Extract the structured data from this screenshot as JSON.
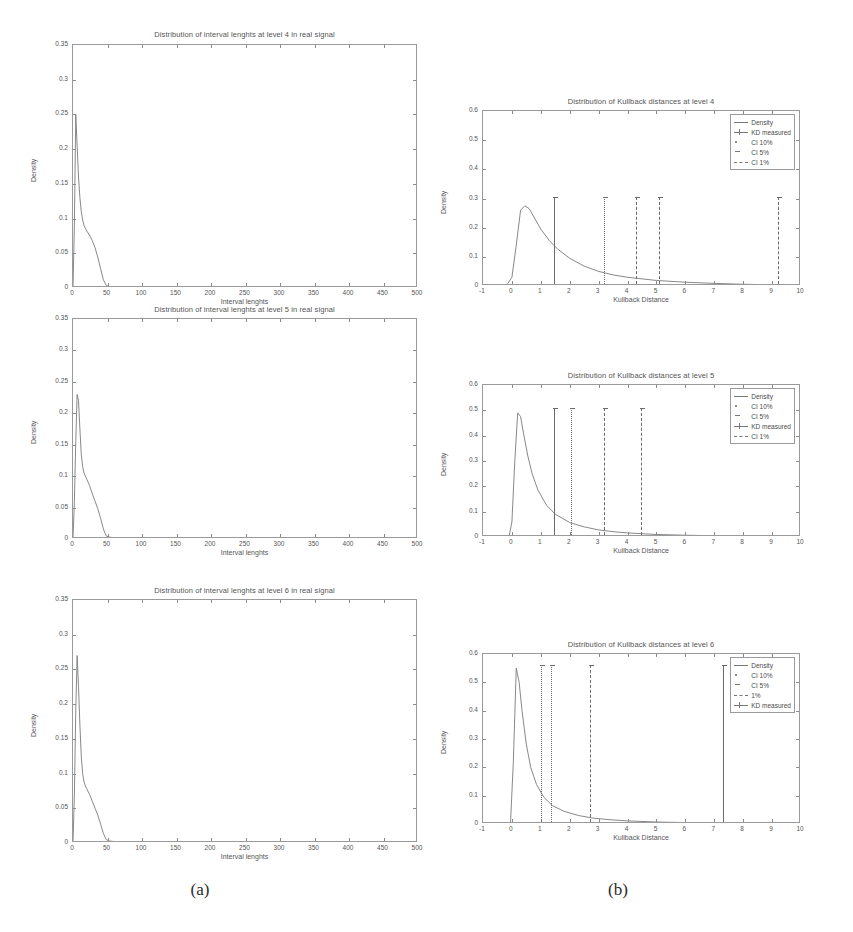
{
  "figure": {
    "captions": [
      {
        "label": "(a)",
        "x": 200,
        "y": 880
      },
      {
        "label": "(b)",
        "x": 618,
        "y": 880
      }
    ]
  },
  "chart_data": [
    {
      "id": "interval-level-4",
      "type": "line",
      "title": "Distribution of interval lenghts at level 4  in real signal",
      "xlabel": "Interval lenghts",
      "ylabel": "Density",
      "xlim": [
        0,
        500
      ],
      "ylim": [
        0,
        0.35
      ],
      "xticks": [
        0,
        50,
        100,
        150,
        200,
        250,
        300,
        350,
        400,
        450,
        500
      ],
      "yticks": [
        0,
        0.05,
        0.1,
        0.15,
        0.2,
        0.25,
        0.3,
        0.35
      ],
      "ytick_labels": [
        "0",
        "0.05",
        "0.1",
        "0.15",
        "0.2",
        "0.25",
        "0.3",
        "0.35"
      ],
      "grid": false,
      "series": [
        {
          "name": "Density",
          "x": [
            0,
            2,
            4,
            6,
            8,
            10,
            12,
            14,
            16,
            18,
            20,
            24,
            28,
            32,
            36,
            40,
            44,
            48,
            52,
            60,
            70,
            80,
            100,
            150,
            200,
            250,
            300,
            350,
            400,
            450,
            500
          ],
          "y": [
            0.0,
            0.09,
            0.25,
            0.205,
            0.16,
            0.13,
            0.11,
            0.098,
            0.09,
            0.086,
            0.082,
            0.076,
            0.068,
            0.058,
            0.044,
            0.028,
            0.012,
            0.004,
            0.002,
            0.0015,
            0.001,
            0.001,
            0.0008,
            0.0006,
            0.0005,
            0.0004,
            0.0003,
            0.0002,
            0.0002,
            0.0001,
            0.0001
          ]
        }
      ]
    },
    {
      "id": "kullback-level-4",
      "type": "line",
      "title": "Distribution of Kullback distances at level 4",
      "xlabel": "Kullback Distance",
      "ylabel": "Density",
      "xlim": [
        -1,
        10
      ],
      "ylim": [
        0,
        0.6
      ],
      "xticks": [
        -1,
        0,
        1,
        2,
        3,
        4,
        5,
        6,
        7,
        8,
        9,
        10
      ],
      "yticks": [
        0,
        0.1,
        0.2,
        0.3,
        0.4,
        0.5,
        0.6
      ],
      "ytick_labels": [
        "0",
        "0.1",
        "0.2",
        "0.3",
        "0.4",
        "0.5",
        "0.6"
      ],
      "grid": false,
      "series": [
        {
          "name": "Density",
          "x": [
            -1,
            -0.2,
            0.0,
            0.15,
            0.3,
            0.45,
            0.6,
            0.8,
            1.0,
            1.3,
            1.6,
            2.0,
            2.5,
            3.0,
            3.5,
            4.0,
            5.0,
            6.0,
            7.0,
            8.0,
            9.0,
            10.0
          ],
          "y": [
            0.0,
            0.0,
            0.03,
            0.14,
            0.26,
            0.275,
            0.265,
            0.23,
            0.195,
            0.155,
            0.125,
            0.095,
            0.068,
            0.05,
            0.038,
            0.03,
            0.019,
            0.013,
            0.009,
            0.006,
            0.004,
            0.003
          ]
        }
      ],
      "markers": [
        {
          "name": "KD measured",
          "x": 1.45,
          "height": 0.3,
          "style": "solid"
        },
        {
          "name": "CI 10%",
          "x": 3.2,
          "height": 0.3,
          "style": "dotted"
        },
        {
          "name": "CI 5%",
          "x": 4.3,
          "height": 0.3,
          "style": "dashed"
        },
        {
          "name": "CI 1%",
          "x": 5.1,
          "height": 0.3,
          "style": "dashed"
        },
        {
          "name": "CI 1%",
          "x": 9.2,
          "height": 0.3,
          "style": "dashed"
        }
      ],
      "legend": {
        "position": "top-right",
        "entries": [
          {
            "label": "Density",
            "symbol": "solid"
          },
          {
            "label": "KD measured",
            "symbol": "cross"
          },
          {
            "label": "CI 10%",
            "symbol": "dot"
          },
          {
            "label": "CI 5%",
            "symbol": "dot2"
          },
          {
            "label": "CI 1%",
            "symbol": "dashdot"
          }
        ]
      }
    },
    {
      "id": "interval-level-5",
      "type": "line",
      "title": "Distribution of interval lenghts at level 5  in real signal",
      "xlabel": "Interval lenghts",
      "ylabel": "Density",
      "xlim": [
        0,
        500
      ],
      "ylim": [
        0,
        0.35
      ],
      "xticks": [
        0,
        50,
        100,
        150,
        200,
        250,
        300,
        350,
        400,
        450,
        500
      ],
      "yticks": [
        0,
        0.05,
        0.1,
        0.15,
        0.2,
        0.25,
        0.3,
        0.35
      ],
      "ytick_labels": [
        "0",
        "0.05",
        "0.1",
        "0.15",
        "0.2",
        "0.25",
        "0.3",
        "0.35"
      ],
      "grid": false,
      "series": [
        {
          "name": "Density",
          "x": [
            0,
            2,
            4,
            6,
            8,
            10,
            12,
            14,
            16,
            18,
            20,
            24,
            28,
            32,
            36,
            40,
            44,
            48,
            52,
            60,
            70,
            80,
            100,
            150,
            200,
            250,
            300,
            350,
            400,
            450,
            500
          ],
          "y": [
            0.0,
            0.06,
            0.155,
            0.23,
            0.22,
            0.175,
            0.135,
            0.115,
            0.105,
            0.1,
            0.095,
            0.085,
            0.072,
            0.06,
            0.048,
            0.033,
            0.016,
            0.005,
            0.003,
            0.002,
            0.0015,
            0.0012,
            0.001,
            0.0008,
            0.0006,
            0.0005,
            0.0004,
            0.0003,
            0.0002,
            0.0002,
            0.0001
          ]
        }
      ]
    },
    {
      "id": "kullback-level-5",
      "type": "line",
      "title": "Distribution of Kullback distances at level 5",
      "xlabel": "Kullback Distance",
      "ylabel": "Density",
      "xlim": [
        -1,
        10
      ],
      "ylim": [
        0,
        0.6
      ],
      "xticks": [
        -1,
        0,
        1,
        2,
        3,
        4,
        5,
        6,
        7,
        8,
        9,
        10
      ],
      "yticks": [
        0,
        0.1,
        0.2,
        0.3,
        0.4,
        0.5,
        0.6
      ],
      "ytick_labels": [
        "0",
        "0.1",
        "0.2",
        "0.3",
        "0.4",
        "0.5",
        "0.6"
      ],
      "grid": false,
      "series": [
        {
          "name": "Density",
          "x": [
            -1,
            -0.1,
            0.0,
            0.1,
            0.2,
            0.3,
            0.4,
            0.55,
            0.7,
            0.9,
            1.2,
            1.5,
            2.0,
            2.5,
            3.0,
            3.5,
            4.0,
            5.0,
            6.0,
            7.0,
            8.0,
            9.0,
            10.0
          ],
          "y": [
            0.0,
            0.0,
            0.06,
            0.3,
            0.49,
            0.475,
            0.41,
            0.32,
            0.25,
            0.185,
            0.125,
            0.09,
            0.057,
            0.04,
            0.028,
            0.021,
            0.016,
            0.01,
            0.007,
            0.005,
            0.004,
            0.003,
            0.002
          ]
        }
      ],
      "markers": [
        {
          "name": "KD measured",
          "x": 1.45,
          "height": 0.5,
          "style": "solid"
        },
        {
          "name": "CI 10%",
          "x": 2.05,
          "height": 0.5,
          "style": "dotted"
        },
        {
          "name": "CI 5%",
          "x": 3.2,
          "height": 0.5,
          "style": "dashed"
        },
        {
          "name": "CI 1%",
          "x": 4.45,
          "height": 0.5,
          "style": "dashed"
        }
      ],
      "legend": {
        "position": "top-right",
        "entries": [
          {
            "label": "Density",
            "symbol": "solid"
          },
          {
            "label": "CI 10%",
            "symbol": "dot"
          },
          {
            "label": "CI 5%",
            "symbol": "dot2"
          },
          {
            "label": "KD measured",
            "symbol": "cross"
          },
          {
            "label": "CI 1%",
            "symbol": "dashdot"
          }
        ]
      }
    },
    {
      "id": "interval-level-6",
      "type": "line",
      "title": "Distribution of interval lenghts at level 6  in real signal",
      "xlabel": "Interval lenghts",
      "ylabel": "Density",
      "xlim": [
        0,
        500
      ],
      "ylim": [
        0,
        0.35
      ],
      "xticks": [
        0,
        50,
        100,
        150,
        200,
        250,
        300,
        350,
        400,
        450,
        500
      ],
      "yticks": [
        0,
        0.05,
        0.1,
        0.15,
        0.2,
        0.25,
        0.3,
        0.35
      ],
      "ytick_labels": [
        "0",
        "0.05",
        "0.1",
        "0.15",
        "0.2",
        "0.25",
        "0.3",
        "0.35"
      ],
      "grid": false,
      "series": [
        {
          "name": "Density",
          "x": [
            0,
            2,
            4,
            6,
            8,
            10,
            12,
            14,
            16,
            18,
            20,
            24,
            28,
            32,
            36,
            40,
            44,
            48,
            52,
            60,
            70,
            80,
            100,
            150,
            200,
            250,
            300,
            350,
            400,
            450,
            500
          ],
          "y": [
            0.0,
            0.07,
            0.19,
            0.27,
            0.225,
            0.17,
            0.125,
            0.1,
            0.088,
            0.082,
            0.078,
            0.07,
            0.06,
            0.05,
            0.04,
            0.027,
            0.014,
            0.005,
            0.003,
            0.002,
            0.0015,
            0.0012,
            0.001,
            0.0008,
            0.0006,
            0.0005,
            0.0004,
            0.0003,
            0.0002,
            0.0002,
            0.0001
          ]
        }
      ]
    },
    {
      "id": "kullback-level-6",
      "type": "line",
      "title": "Distribution of Kullback distances at level 6",
      "xlabel": "Kullback Distance",
      "ylabel": "Density",
      "xlim": [
        -1,
        10
      ],
      "ylim": [
        0,
        0.6
      ],
      "xticks": [
        -1,
        0,
        1,
        2,
        3,
        4,
        5,
        6,
        7,
        8,
        9,
        10
      ],
      "yticks": [
        0,
        0.1,
        0.2,
        0.3,
        0.4,
        0.5,
        0.6
      ],
      "ytick_labels": [
        "0",
        "0.1",
        "0.2",
        "0.3",
        "0.4",
        "0.5",
        "0.6"
      ],
      "grid": false,
      "series": [
        {
          "name": "Density",
          "x": [
            -1,
            -0.05,
            0.05,
            0.15,
            0.25,
            0.35,
            0.5,
            0.65,
            0.85,
            1.1,
            1.4,
            1.8,
            2.3,
            2.8,
            3.4,
            4.0,
            5.0,
            6.0,
            7.0,
            8.0,
            9.0,
            10.0
          ],
          "y": [
            0.0,
            0.0,
            0.22,
            0.55,
            0.5,
            0.4,
            0.28,
            0.2,
            0.14,
            0.095,
            0.065,
            0.045,
            0.03,
            0.021,
            0.015,
            0.011,
            0.007,
            0.005,
            0.004,
            0.003,
            0.002,
            0.002
          ]
        }
      ],
      "markers": [
        {
          "name": "CI 10%",
          "x": 1.0,
          "height": 0.555,
          "style": "dotted"
        },
        {
          "name": "CI 5%",
          "x": 1.35,
          "height": 0.555,
          "style": "dotted"
        },
        {
          "name": "1%",
          "x": 2.7,
          "height": 0.555,
          "style": "dashed"
        },
        {
          "name": "KD measured",
          "x": 7.3,
          "height": 0.555,
          "style": "solid"
        }
      ],
      "legend": {
        "position": "top-right",
        "entries": [
          {
            "label": "Density",
            "symbol": "solid"
          },
          {
            "label": "CI 10%",
            "symbol": "dot"
          },
          {
            "label": "CI 5%",
            "symbol": "dot2"
          },
          {
            "label": "1%",
            "symbol": "dashdot"
          },
          {
            "label": "KD measured",
            "symbol": "cross"
          }
        ]
      }
    }
  ]
}
